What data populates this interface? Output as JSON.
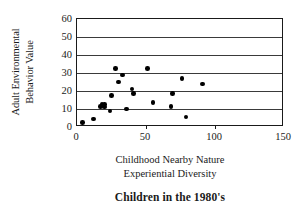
{
  "chart_data": {
    "type": "scatter",
    "title": "Children in the 1980's",
    "xlabel": "Childhood Nearby Nature Experiential Diversity",
    "xlabel_lines": [
      "Childhood Nearby Nature",
      "Experiential Diversity"
    ],
    "ylabel": "Adult Environmental Behavior Value",
    "ylabel_lines": [
      "Adult Environmental",
      "Behavior  Value"
    ],
    "xlim": [
      0,
      150
    ],
    "ylim": [
      0,
      60
    ],
    "xticks": [
      0,
      50,
      100,
      150
    ],
    "yticks": [
      0,
      10,
      20,
      30,
      40,
      50,
      60
    ],
    "grid": "horizontal",
    "legend": "none",
    "series": [
      {
        "name": "Children in the 1980's",
        "marker": "filled-diamond",
        "color": "#000000",
        "points": [
          {
            "x": 4,
            "y": 2.5
          },
          {
            "x": 12,
            "y": 4.5
          },
          {
            "x": 17,
            "y": 11.5
          },
          {
            "x": 18,
            "y": 12.5
          },
          {
            "x": 19,
            "y": 12.0
          },
          {
            "x": 20,
            "y": 12.5
          },
          {
            "x": 20,
            "y": 11.0
          },
          {
            "x": 24,
            "y": 9.0
          },
          {
            "x": 25,
            "y": 17.5
          },
          {
            "x": 28,
            "y": 32.5
          },
          {
            "x": 30,
            "y": 25.0
          },
          {
            "x": 33,
            "y": 29.0
          },
          {
            "x": 36,
            "y": 10.0
          },
          {
            "x": 40,
            "y": 21.0
          },
          {
            "x": 41,
            "y": 18.5
          },
          {
            "x": 51,
            "y": 32.5
          },
          {
            "x": 55,
            "y": 13.5
          },
          {
            "x": 68,
            "y": 11.5
          },
          {
            "x": 69,
            "y": 18.5
          },
          {
            "x": 76,
            "y": 27.0
          },
          {
            "x": 79,
            "y": 5.5
          },
          {
            "x": 91,
            "y": 24.0
          }
        ]
      }
    ]
  }
}
